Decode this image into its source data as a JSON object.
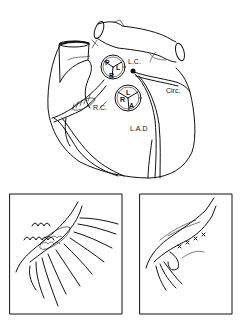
{
  "figure": {
    "heart": {
      "pulmonary_valve_cusps": [
        "P",
        "L",
        "R"
      ],
      "aortic_valve_cusps": [
        "L",
        "R",
        "A"
      ],
      "labels": {
        "left_coronary": "L.C.",
        "circumflex": "Circ.",
        "right_coronary": "R.C.",
        "lad": "L.A.D"
      }
    },
    "panels": [
      {
        "id": "left",
        "content": "vessel with fistula and drainage branches, sutures along upper edge"
      },
      {
        "id": "right",
        "content": "vessel after repair with suture line"
      }
    ],
    "colors": {
      "line": "#111111",
      "background": "#ffffff"
    }
  }
}
